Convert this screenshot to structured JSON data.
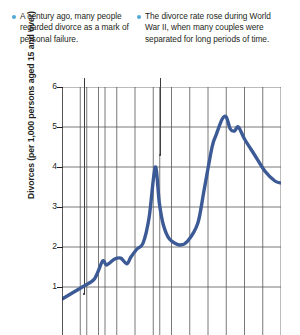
{
  "annotations": [
    {
      "id": "century-ago-note",
      "text": "A century ago, many people regarded divorce as a mark of personal failure.",
      "bullet_color": "#4fa9d8",
      "points_to_year": 1910,
      "points_to_value": 1.0
    },
    {
      "id": "world-war-ii-note",
      "text": "The divorce rate rose during World War II, when many couples were separated for long periods of time.",
      "bullet_color": "#4fa9d8",
      "points_to_year": 1946,
      "points_to_value": 4.3
    }
  ],
  "chart_data": {
    "type": "line",
    "title": "",
    "xlabel": "",
    "ylabel": "Divorces (per 1,000 persons aged 15 and over)",
    "ylim": [
      0,
      6
    ],
    "yticks": [
      1,
      2,
      3,
      4,
      5,
      6
    ],
    "xlim": [
      1900,
      2008
    ],
    "grid": true,
    "legend": "none",
    "line_color": "#3c5a96",
    "line_width": 3.4,
    "note": "bottom of plot and x-axis tick labels are cropped out of the screenshot",
    "series": [
      {
        "name": "Divorce rate",
        "x": [
          1900,
          1910,
          1916,
          1920,
          1922,
          1926,
          1929,
          1932,
          1934,
          1937,
          1940,
          1943,
          1946,
          1948,
          1950,
          1953,
          1958,
          1962,
          1967,
          1970,
          1974,
          1976,
          1979,
          1981,
          1983,
          1985,
          1987,
          1990,
          1995,
          2000,
          2005,
          2008
        ],
        "values": [
          0.7,
          1.0,
          1.2,
          1.65,
          1.55,
          1.7,
          1.72,
          1.58,
          1.75,
          1.95,
          2.1,
          2.75,
          4.0,
          3.1,
          2.55,
          2.2,
          2.05,
          2.15,
          2.6,
          3.4,
          4.5,
          4.8,
          5.2,
          5.25,
          4.95,
          4.9,
          5.0,
          4.7,
          4.3,
          3.9,
          3.65,
          3.6
        ]
      }
    ]
  }
}
